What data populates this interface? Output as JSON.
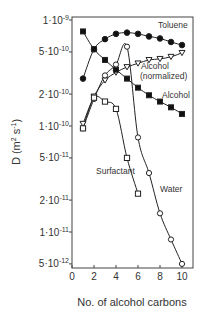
{
  "chart_data": {
    "type": "line",
    "title": "",
    "xlabel": "No. of alcohol carbons",
    "ylabel": "D (m² s⁻¹)",
    "ylabel_parts": {
      "main": "D (m",
      "sup1": "2",
      "mid": " s",
      "sup2": "-1",
      "end": ")"
    },
    "xlim": [
      0,
      10.5
    ],
    "ylim": [
      4.5e-12,
      1.1e-09
    ],
    "yscale": "log",
    "grid": false,
    "legend": "inline labels",
    "x_ticks": [
      0,
      2,
      4,
      6,
      8,
      10
    ],
    "x_tick_labels": [
      "0",
      "2",
      "4",
      "6",
      "8",
      "10"
    ],
    "y_ticks": [
      1e-09,
      5e-10,
      2e-10,
      1e-10,
      5e-11,
      2e-11,
      1e-11,
      5e-12
    ],
    "y_tick_labels": [
      {
        "mant": "1",
        "exp": "-9"
      },
      {
        "mant": "5",
        "exp": "-10"
      },
      {
        "mant": "2",
        "exp": "-10"
      },
      {
        "mant": "1",
        "exp": "-10"
      },
      {
        "mant": "5",
        "exp": "-11"
      },
      {
        "mant": "2",
        "exp": "-11"
      },
      {
        "mant": "1",
        "exp": "-11"
      },
      {
        "mant": "5",
        "exp": "-12"
      }
    ],
    "series": [
      {
        "name": "Toluene",
        "marker": "filled-circle",
        "x": [
          1,
          2,
          3,
          4,
          5,
          6,
          7,
          8,
          9,
          10
        ],
        "values": [
          2.8e-10,
          5.3e-10,
          6.6e-10,
          7.4e-10,
          7.6e-10,
          7.4e-10,
          7e-10,
          6.7e-10,
          6.2e-10,
          5.8e-10
        ],
        "label_pos": {
          "x": 8.6,
          "y": 8e-10
        }
      },
      {
        "name": "Alcohol (normalized)",
        "marker": "open-triangle",
        "x": [
          1,
          2,
          3,
          4,
          5,
          6,
          7,
          8,
          9,
          10
        ],
        "values": [
          1.05e-10,
          1.9e-10,
          2.7e-10,
          3.2e-10,
          3.6e-10,
          3.9e-10,
          4.2e-10,
          4.3e-10,
          4.5e-10,
          4.9e-10
        ],
        "label_pos": {
          "x": 7.6,
          "y": 3.1e-10
        }
      },
      {
        "name": "Alcohol",
        "marker": "filled-square",
        "x": [
          1,
          2,
          3,
          4,
          5,
          6,
          7,
          8,
          9,
          10
        ],
        "values": [
          7.8e-10,
          5.3e-10,
          4.2e-10,
          3.4e-10,
          2.8e-10,
          2.3e-10,
          1.95e-10,
          1.7e-10,
          1.5e-10,
          1.3e-10
        ],
        "label_pos": {
          "x": 8.2,
          "y": 1.9e-10
        }
      },
      {
        "name": "Water",
        "marker": "open-circle",
        "x": [
          1,
          2,
          3,
          4,
          5,
          6,
          7,
          8,
          9,
          10
        ],
        "values": [
          9.5e-11,
          1.8e-10,
          3e-10,
          3.8e-10,
          5.6e-10,
          7.8e-11,
          3.6e-11,
          1.5e-11,
          8.5e-12,
          5e-12
        ],
        "label_pos": {
          "x": 6.2,
          "y": 2e-11
        }
      },
      {
        "name": "Surfactant",
        "marker": "open-square",
        "x": [
          1,
          2,
          3,
          4,
          5,
          6
        ],
        "values": [
          9.5e-11,
          1.85e-10,
          1.7e-10,
          1.45e-10,
          5e-11,
          2.3e-11
        ],
        "label_pos": {
          "x": 1.3,
          "y": 3.4e-11
        }
      }
    ]
  },
  "labels": {
    "toluene": "Toluene",
    "alcohol_norm_1": "Alcohol",
    "alcohol_norm_2": "(normalized)",
    "alcohol": "Alcohol",
    "water": "Water",
    "surfactant": "Surfactant"
  }
}
